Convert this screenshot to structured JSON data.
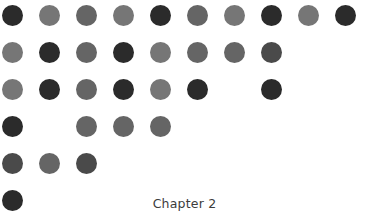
{
  "page": {
    "background_color": "#ffffff",
    "width": 369,
    "height": 216
  },
  "footer": {
    "chapter_label": "Chapter 2"
  },
  "dot_grid": {
    "rows": 6,
    "columns": 10,
    "x_start": 12,
    "y_start": 15,
    "x_spacing": 37,
    "y_spacing": 37,
    "dot_diameter": 21,
    "palette": {
      "dark": "#2b2b2b",
      "medium_dark": "#4a4a4a",
      "medium": "#656565",
      "light_medium": "#767676",
      "empty": null
    },
    "cells": [
      [
        "dark",
        "light_medium",
        "medium",
        "light_medium",
        "dark",
        "medium",
        "light_medium",
        "dark",
        "light_medium",
        "dark"
      ],
      [
        "light_medium",
        "dark",
        "medium",
        "dark",
        "light_medium",
        "medium",
        "medium",
        "medium_dark",
        null,
        null
      ],
      [
        "light_medium",
        "dark",
        "medium",
        "dark",
        "light_medium",
        "dark",
        null,
        "dark",
        null,
        null
      ],
      [
        "dark",
        null,
        "medium",
        "medium",
        "medium",
        null,
        null,
        null,
        null,
        null
      ],
      [
        "medium_dark",
        "medium",
        "medium_dark",
        null,
        null,
        null,
        null,
        null,
        null,
        null
      ],
      [
        "dark",
        null,
        null,
        null,
        null,
        null,
        null,
        null,
        null,
        null
      ]
    ]
  }
}
